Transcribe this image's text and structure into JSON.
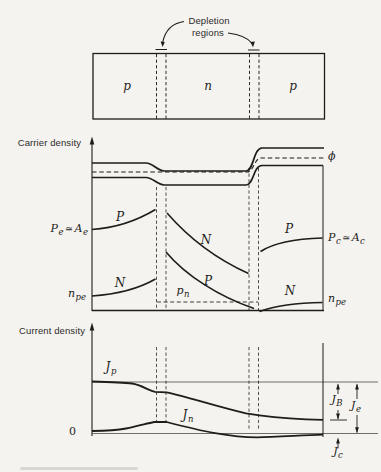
{
  "figure": {
    "device": {
      "depletion_label": {
        "line1": "Depletion",
        "line2": "regions"
      },
      "regions": [
        {
          "label": "p"
        },
        {
          "label": "n"
        },
        {
          "label": "p"
        }
      ]
    },
    "carrier": {
      "axis_label": "Carrier density",
      "phi_label": "ϕ",
      "emitter": {
        "p_curve_label": "P",
        "n_curve_label": "N",
        "p_level": {
          "lhs": "P",
          "lhs_sub": "e",
          "rel": "≃",
          "rhs": "A",
          "rhs_sub": "e"
        },
        "n_level": {
          "base": "n",
          "sub": "pe"
        }
      },
      "base": {
        "n_curve_label": "N",
        "p_curve_label": "P",
        "pn_level": {
          "base": "p",
          "sub": "n"
        }
      },
      "collector": {
        "p_curve_label": "P",
        "n_curve_label": "N",
        "p_level": {
          "lhs": "P",
          "lhs_sub": "c",
          "rel": "≃",
          "rhs": "A",
          "rhs_sub": "c"
        },
        "n_level": {
          "base": "n",
          "sub": "pe"
        }
      }
    },
    "current": {
      "axis_label": "Current density",
      "zero_label": "0",
      "jp": {
        "base": "J",
        "sub": "p"
      },
      "jn": {
        "base": "J",
        "sub": "n"
      },
      "jb": {
        "base": "J",
        "sub": "B"
      },
      "je": {
        "base": "J",
        "sub": "e"
      },
      "jc": {
        "base": "J",
        "sub": "c"
      }
    },
    "colors": {
      "ink": "#1d1d1b",
      "paper": "#f5f3ef"
    }
  }
}
